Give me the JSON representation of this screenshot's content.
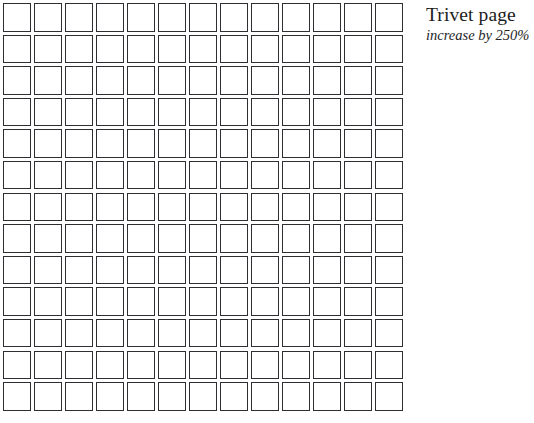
{
  "page": {
    "background_color": "#ffffff",
    "width": 529,
    "height": 423
  },
  "caption": {
    "title": "Trivet page",
    "subtitle": "increase by 250%"
  },
  "grid": {
    "columns": 13,
    "rows": 13,
    "total_cells": 169,
    "cell_border_color": "#2e2e32",
    "cell_fill_color": "#ffffff",
    "cells": [
      [
        "",
        "",
        "",
        "",
        "",
        "",
        "",
        "",
        "",
        "",
        "",
        "",
        ""
      ],
      [
        "",
        "",
        "",
        "",
        "",
        "",
        "",
        "",
        "",
        "",
        "",
        "",
        ""
      ],
      [
        "",
        "",
        "",
        "",
        "",
        "",
        "",
        "",
        "",
        "",
        "",
        "",
        ""
      ],
      [
        "",
        "",
        "",
        "",
        "",
        "",
        "",
        "",
        "",
        "",
        "",
        "",
        ""
      ],
      [
        "",
        "",
        "",
        "",
        "",
        "",
        "",
        "",
        "",
        "",
        "",
        "",
        ""
      ],
      [
        "",
        "",
        "",
        "",
        "",
        "",
        "",
        "",
        "",
        "",
        "",
        "",
        ""
      ],
      [
        "",
        "",
        "",
        "",
        "",
        "",
        "",
        "",
        "",
        "",
        "",
        "",
        ""
      ],
      [
        "",
        "",
        "",
        "",
        "",
        "",
        "",
        "",
        "",
        "",
        "",
        "",
        ""
      ],
      [
        "",
        "",
        "",
        "",
        "",
        "",
        "",
        "",
        "",
        "",
        "",
        "",
        ""
      ],
      [
        "",
        "",
        "",
        "",
        "",
        "",
        "",
        "",
        "",
        "",
        "",
        "",
        ""
      ],
      [
        "",
        "",
        "",
        "",
        "",
        "",
        "",
        "",
        "",
        "",
        "",
        "",
        ""
      ],
      [
        "",
        "",
        "",
        "",
        "",
        "",
        "",
        "",
        "",
        "",
        "",
        "",
        ""
      ],
      [
        "",
        "",
        "",
        "",
        "",
        "",
        "",
        "",
        "",
        "",
        "",
        "",
        ""
      ]
    ]
  }
}
